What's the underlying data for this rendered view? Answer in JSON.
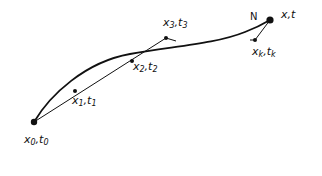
{
  "diagram": {
    "type": "trajectory-sketch",
    "curve": {
      "description": "smooth path from x0,t0 to x,t"
    },
    "chord": {
      "description": "straight line through successive points x0..x3"
    },
    "points": [
      {
        "id": "p0",
        "var": "x",
        "sub": "0",
        "tvar": "t",
        "tsub": "0",
        "cx": 34,
        "cy": 122
      },
      {
        "id": "p1",
        "var": "x",
        "sub": "1",
        "tvar": "t",
        "tsub": "1",
        "cx": 75,
        "cy": 91
      },
      {
        "id": "p2",
        "var": "x",
        "sub": "2",
        "tvar": "t",
        "tsub": "2",
        "cx": 132,
        "cy": 61
      },
      {
        "id": "p3",
        "var": "x",
        "sub": "3",
        "tvar": "t",
        "tsub": "3",
        "cx": 166,
        "cy": 38
      },
      {
        "id": "pk",
        "var": "x",
        "sub": "k",
        "tvar": "t",
        "tsub": "k",
        "cx": 255,
        "cy": 40
      },
      {
        "id": "pend",
        "var": "x",
        "tvar": "t",
        "cx": 270,
        "cy": 20
      }
    ],
    "labels": {
      "p0": {
        "x": "x",
        "xs": "0",
        "sep": ",",
        "t": "t",
        "ts": "0"
      },
      "p1": {
        "x": "x",
        "xs": "1",
        "sep": ",",
        "t": "t",
        "ts": "1"
      },
      "p2": {
        "x": "x",
        "xs": "2",
        "sep": ",",
        "t": "t",
        "ts": "2"
      },
      "p3": {
        "x": "x",
        "xs": "3",
        "sep": ",",
        "t": "t",
        "ts": "3"
      },
      "pk": {
        "x": "x",
        "xs": "k",
        "sep": ",",
        "t": "t",
        "ts": "k"
      },
      "pend": {
        "text": "x,t"
      },
      "n": "N"
    },
    "colors": {
      "ink": "#111111",
      "background": "#ffffff"
    }
  }
}
